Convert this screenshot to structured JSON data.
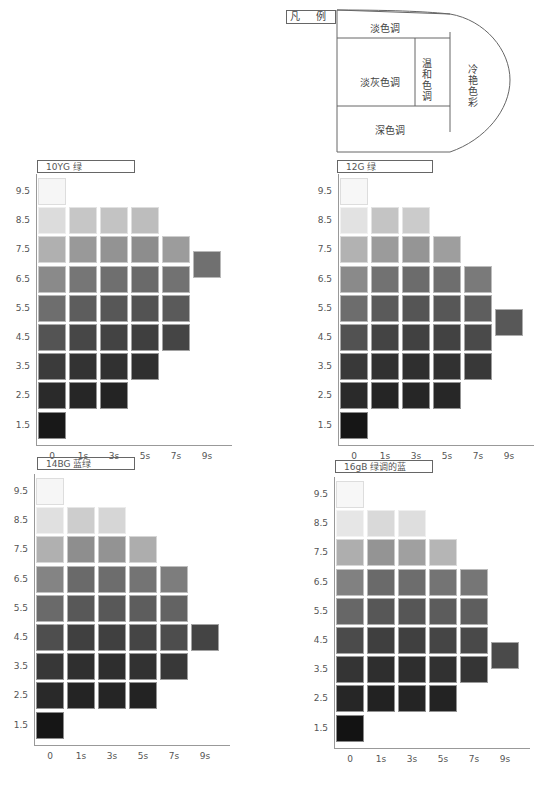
{
  "legend": {
    "tag": "凡 例",
    "regions": {
      "top": "淡色调",
      "middle_left": "淡灰色调",
      "middle_right": "温和色调",
      "bottom": "深色调",
      "outer": "冷艳色彩"
    }
  },
  "chart_data": [
    {
      "type": "heatmap",
      "title": "10YG  绿",
      "x": [
        "0",
        "1s",
        "3s",
        "5s",
        "7s",
        "9s"
      ],
      "y": [
        "9.5",
        "8.5",
        "7.5",
        "6.5",
        "5.5",
        "4.5",
        "3.5",
        "2.5",
        "1.5"
      ],
      "cells": [
        {
          "y": "9.5",
          "cols": [
            "#f6f6f6"
          ]
        },
        {
          "y": "8.5",
          "cols": [
            "#dcdcdc",
            "#c6c6c6",
            "#c3c3c3",
            "#bdbdbd"
          ]
        },
        {
          "y": "7.5",
          "cols": [
            "#b0b0b0",
            "#999",
            "#939393",
            "#8d8d8d",
            "#9c9c9c"
          ],
          "extra": {
            "col": "9s",
            "row_offset": 0.5,
            "color": "#707070"
          }
        },
        {
          "y": "6.5",
          "cols": [
            "#8a8a8a",
            "#767676",
            "#6f6f6f",
            "#6a6a6a",
            "#727272"
          ]
        },
        {
          "y": "5.5",
          "cols": [
            "#6e6e6e",
            "#5d5d5d",
            "#575757",
            "#535353",
            "#5a5a5a"
          ]
        },
        {
          "y": "4.5",
          "cols": [
            "#545454",
            "#474747",
            "#434343",
            "#3f3f3f",
            "#454545"
          ]
        },
        {
          "y": "3.5",
          "cols": [
            "#3b3b3b",
            "#333",
            "#313131",
            "#2f2f2f"
          ]
        },
        {
          "y": "2.5",
          "cols": [
            "#2a2a2a",
            "#262626",
            "#242424"
          ]
        },
        {
          "y": "1.5",
          "cols": [
            "#181818"
          ]
        }
      ]
    },
    {
      "type": "heatmap",
      "title": "12G  绿",
      "x": [
        "0",
        "1s",
        "3s",
        "5s",
        "7s",
        "9s"
      ],
      "y": [
        "9.5",
        "8.5",
        "7.5",
        "6.5",
        "5.5",
        "4.5",
        "3.5",
        "2.5",
        "1.5"
      ],
      "cells": [
        {
          "y": "9.5",
          "cols": [
            "#f7f7f7"
          ]
        },
        {
          "y": "8.5",
          "cols": [
            "#e2e2e2",
            "#c4c4c4",
            "#cbcbcb"
          ]
        },
        {
          "y": "7.5",
          "cols": [
            "#b2b2b2",
            "#9b9b9b",
            "#959595",
            "#9e9e9e"
          ]
        },
        {
          "y": "6.5",
          "cols": [
            "#8a8a8a",
            "#727272",
            "#6c6c6c",
            "#6e6e6e",
            "#7a7a7a"
          ]
        },
        {
          "y": "5.5",
          "cols": [
            "#6d6d6d",
            "#5a5a5a",
            "#555",
            "#575757",
            "#5e5e5e"
          ],
          "extra": {
            "col": "9s",
            "row_offset": 0.5,
            "color": "#585858"
          }
        },
        {
          "y": "4.5",
          "cols": [
            "#525252",
            "#444",
            "#414141",
            "#424242",
            "#4a4a4a"
          ]
        },
        {
          "y": "3.5",
          "cols": [
            "#393939",
            "#313131",
            "#2f2f2f",
            "#313131",
            "#383838"
          ]
        },
        {
          "y": "2.5",
          "cols": [
            "#2a2a2a",
            "#252525",
            "#262626",
            "#272727"
          ]
        },
        {
          "y": "1.5",
          "cols": [
            "#161616"
          ]
        }
      ]
    },
    {
      "type": "heatmap",
      "title": "14BG  蓝绿",
      "x": [
        "0",
        "1s",
        "3s",
        "5s",
        "7s",
        "9s"
      ],
      "y": [
        "9.5",
        "8.5",
        "7.5",
        "6.5",
        "5.5",
        "4.5",
        "3.5",
        "2.5",
        "1.5"
      ],
      "cells": [
        {
          "y": "9.5",
          "cols": [
            "#f6f6f6"
          ]
        },
        {
          "y": "8.5",
          "cols": [
            "#e0e0e0",
            "#cdcdcd",
            "#d6d6d6"
          ]
        },
        {
          "y": "7.5",
          "cols": [
            "#b0b0b0",
            "#8e8e8e",
            "#939393",
            "#adadad"
          ]
        },
        {
          "y": "6.5",
          "cols": [
            "#848484",
            "#6a6a6a",
            "#6d6d6d",
            "#747474",
            "#7d7d7d"
          ]
        },
        {
          "y": "5.5",
          "cols": [
            "#6a6a6a",
            "#585858",
            "#585858",
            "#5d5d5d",
            "#636363"
          ]
        },
        {
          "y": "4.5",
          "cols": [
            "#4e4e4e",
            "#404040",
            "#404040",
            "#454545",
            "#4d4d4d",
            "#444"
          ]
        },
        {
          "y": "3.5",
          "cols": [
            "#373737",
            "#2f2f2f",
            "#2e2e2e",
            "#323232",
            "#383838"
          ]
        },
        {
          "y": "2.5",
          "cols": [
            "#292929",
            "#242424",
            "#252525",
            "#232323"
          ]
        },
        {
          "y": "1.5",
          "cols": [
            "#161616"
          ]
        }
      ]
    },
    {
      "type": "heatmap",
      "title": "16gB  绿调的蓝",
      "x": [
        "0",
        "1s",
        "3s",
        "5s",
        "7s",
        "9s"
      ],
      "y": [
        "9.5",
        "8.5",
        "7.5",
        "6.5",
        "5.5",
        "4.5",
        "3.5",
        "2.5",
        "1.5"
      ],
      "cells": [
        {
          "y": "9.5",
          "cols": [
            "#f7f7f7"
          ]
        },
        {
          "y": "8.5",
          "cols": [
            "#e6e6e6",
            "#d9d9d9",
            "#dedede"
          ]
        },
        {
          "y": "7.5",
          "cols": [
            "#aeaeae",
            "#949494",
            "#a0a0a0",
            "#b5b5b5"
          ]
        },
        {
          "y": "6.5",
          "cols": [
            "#818181",
            "#6a6a6a",
            "#6d6d6d",
            "#747474",
            "#767676"
          ]
        },
        {
          "y": "5.5",
          "cols": [
            "#676767",
            "#575757",
            "#565656",
            "#5c5c5c",
            "#5e5e5e"
          ]
        },
        {
          "y": "4.5",
          "cols": [
            "#4b4b4b",
            "#3f3f3f",
            "#404040",
            "#454545",
            "#494949"
          ],
          "extra": {
            "col": "9s",
            "row_offset": 0.5,
            "color": "#4a4a4a"
          }
        },
        {
          "y": "3.5",
          "cols": [
            "#343434",
            "#2e2e2e",
            "#2e2e2e",
            "#313131",
            "#353535"
          ]
        },
        {
          "y": "2.5",
          "cols": [
            "#262626",
            "#222",
            "#242424",
            "#232323"
          ]
        },
        {
          "y": "1.5",
          "cols": [
            "#131313"
          ]
        }
      ]
    }
  ]
}
